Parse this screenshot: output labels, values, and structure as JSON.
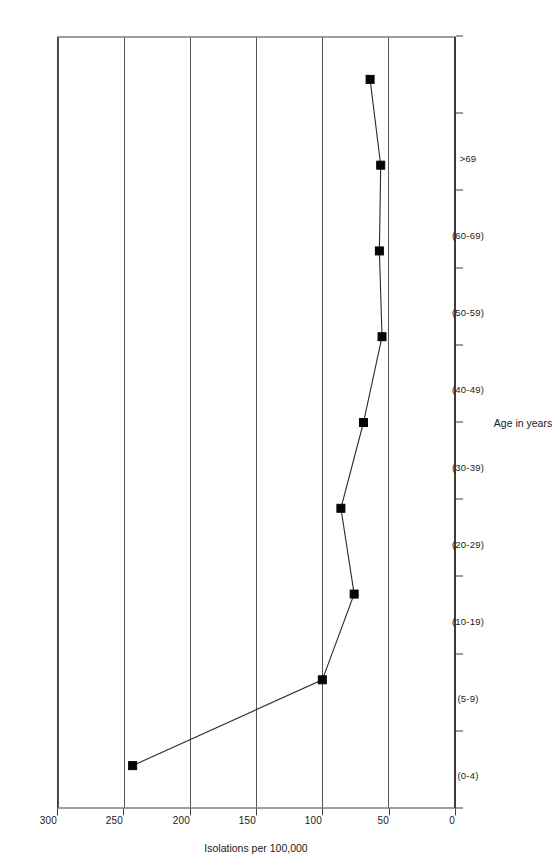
{
  "chart_data": {
    "type": "line",
    "title": "",
    "xlabel": "Age in years",
    "ylabel": "Isolations per 100,000",
    "categories": [
      "(0-4)",
      "(5-9)",
      "(10-19)",
      "(20-29)",
      "(30-39)",
      "(40-49)",
      "(50-59)",
      "(60-69)",
      ">69"
    ],
    "values": [
      243,
      100,
      76,
      86,
      69,
      55,
      57,
      56,
      64
    ],
    "series": [
      {
        "name": "Isolations per 100,000",
        "values": [
          243,
          100,
          76,
          86,
          69,
          55,
          57,
          56,
          64
        ]
      }
    ],
    "ylim": [
      0,
      300
    ],
    "yticks": [
      300,
      250,
      200,
      150,
      100,
      50,
      0
    ],
    "ytick_labels": [
      "300",
      "250",
      "200",
      "150",
      "100",
      "50",
      "0"
    ],
    "xtick_labels": [
      "(0-4)",
      "(5-9)",
      "(10-19)",
      "(20-29)",
      "(30-39)",
      "(40-49)",
      "(50-59)",
      "(60-69)",
      ">69"
    ],
    "grid": true,
    "grid_axis": "y",
    "legend": false,
    "legend_position": "none",
    "marker": "square",
    "marker_color": "#050505",
    "line_color": "#2b2b2b",
    "background_color": "#ffffff",
    "orientation": "rotated-90"
  },
  "axes": {
    "value_axis_title": "Isolations per 100,000",
    "category_axis_title": "Age in years"
  }
}
